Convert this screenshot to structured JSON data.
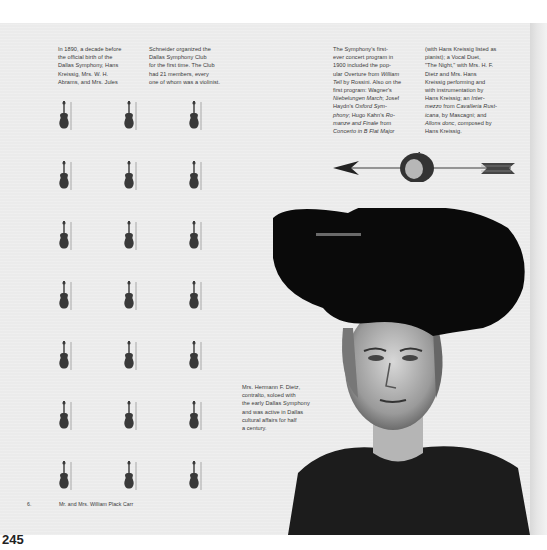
{
  "page_number": "245",
  "columns": {
    "col1": "In 1890, a decade before\nthe official birth of the\nDallas Symphony, Hans\nKreissig, Mrs. W. H.\nAbrams, and Mrs. Jules",
    "col2": "Schneider organized the\nDallas Symphony Club\nfor the first time. The Club\nhad 21 members, every\none of whom was a violinist.",
    "col3": "The Symphony's first-\never concert program in\n1900 included the pop-\nular Overture from William\nTell by Rossini. Also on the\nfirst program: Wagner's\nNiebelungen March; Josef\nHaydn's Oxford Sym-\nphony; Hugo Kahn's Ro-\nmanze and Finale from\nConcerto in B Flat Major",
    "col4": "(with Hans Kreissig listed as\npianist); a Vocal Duet,\n\"The Night,\" with Mrs. H. F.\nDietz and Mrs. Hans\nKreissig performing and\nwith instrumentation by\nHans Kreissig; an Inter-\nmezzo from Cavalleria Rust-\nicana, by Mascagni; and\nAllons donc, composed by\nHans Kreissig."
  },
  "captions": {
    "dietz": "Mrs. Hermann F. Dietz,\ncontralto, soloed with\nthe early Dallas Symphony\nand was active in Dallas\ncultural affairs for half\na century.",
    "carr_number": "6.",
    "carr": "Mr. and Mrs. William Plack Carr"
  },
  "illustrations": {
    "violin_grid": {
      "rows": 7,
      "columns": 3,
      "count": 21,
      "icon": "violin-icon"
    },
    "arrow_through_apple": {
      "icon": "arrow-apple-icon"
    },
    "portrait": {
      "subject": "Mrs. Hermann F. Dietz",
      "icon": "portrait-photo"
    }
  },
  "colors": {
    "page_background": "#ebebeb",
    "text": "#3a3a3a",
    "ink": "#1a1a1a"
  }
}
